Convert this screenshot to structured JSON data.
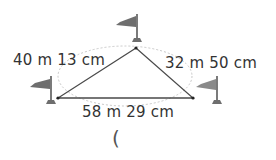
{
  "diagram": {
    "sides": {
      "left": "40 m  13 cm",
      "right": "32 m  50 cm",
      "bottom": "58 m  29 cm"
    },
    "answer_blank": "(",
    "vertices": [
      {
        "name": "top",
        "x": 136,
        "y": 48
      },
      {
        "name": "left",
        "x": 58,
        "y": 98
      },
      {
        "name": "right",
        "x": 193,
        "y": 98
      }
    ],
    "colors": {
      "triangle": "#4a4a4a",
      "flag": "#6e6e6e",
      "dotted_ellipse": "#c8c8c8"
    }
  }
}
